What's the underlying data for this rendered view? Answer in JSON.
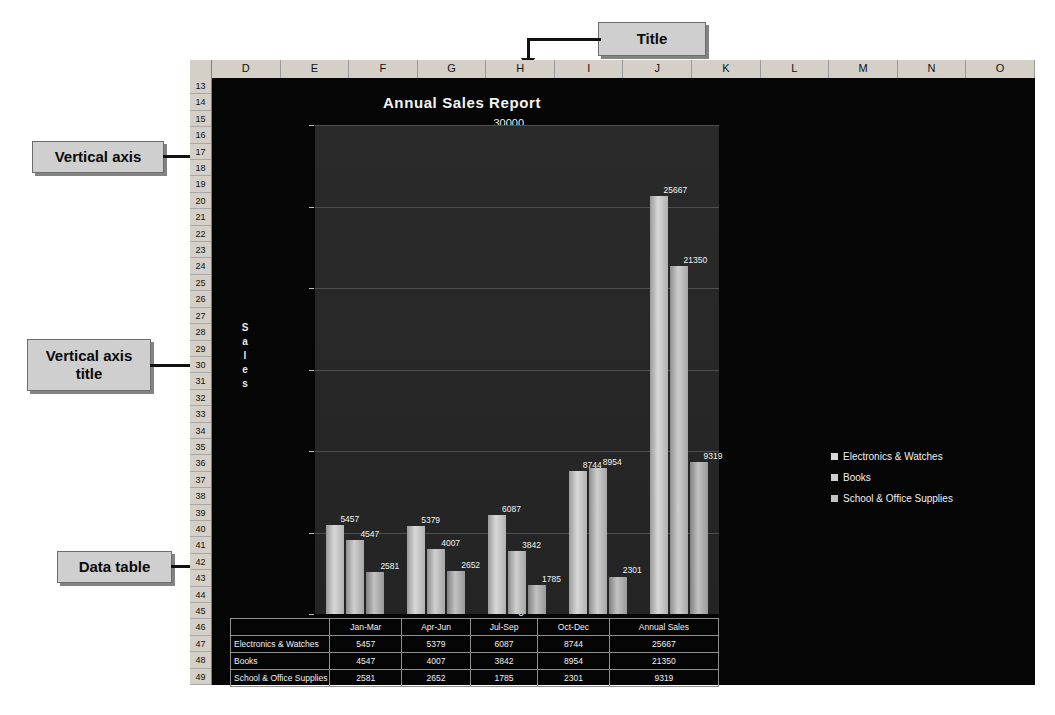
{
  "spreadsheet": {
    "columns": [
      "D",
      "E",
      "F",
      "G",
      "H",
      "I",
      "J",
      "K",
      "L",
      "M",
      "N",
      "O"
    ],
    "rows": [
      13,
      14,
      15,
      16,
      17,
      18,
      19,
      20,
      21,
      22,
      23,
      24,
      25,
      26,
      27,
      28,
      29,
      30,
      31,
      32,
      33,
      34,
      35,
      36,
      37,
      38,
      39,
      40,
      41,
      42,
      43,
      44,
      45,
      46,
      47,
      48,
      49
    ]
  },
  "chart_data": {
    "type": "bar",
    "title": "Annual Sales Report",
    "xlabel": "",
    "ylabel": "Sales",
    "ylim": [
      0,
      30000
    ],
    "yticks": [
      30000,
      25000,
      20000,
      15000,
      10000,
      5000,
      0
    ],
    "grid": true,
    "legend_position": "right",
    "categories": [
      "Jan-Mar",
      "Apr-Jun",
      "Jul-Sep",
      "Oct-Dec",
      "Annual Sales"
    ],
    "series": [
      {
        "name": "Electronics & Watches",
        "color": "#d8d8d8",
        "values": [
          5457,
          5379,
          6087,
          8744,
          25667
        ]
      },
      {
        "name": "Books",
        "color": "#cfcfcf",
        "values": [
          4547,
          4007,
          3842,
          8954,
          21350
        ]
      },
      {
        "name": "School & Office Supplies",
        "color": "#c2c2c2",
        "values": [
          2581,
          2652,
          1785,
          2301,
          9319
        ]
      }
    ],
    "data_labels": [
      "5457",
      "4547",
      "2581",
      "5379",
      "4007",
      "2652",
      "6087",
      "3842",
      "1785",
      "8744",
      "8954",
      "2301",
      "25667",
      "21350",
      "9319"
    ]
  },
  "data_table": {
    "header": [
      "",
      "Jan-Mar",
      "Apr-Jun",
      "Jul-Sep",
      "Oct-Dec",
      "Annual Sales"
    ],
    "rows": [
      [
        "Electronics & Watches",
        "5457",
        "5379",
        "6087",
        "8744",
        "25667"
      ],
      [
        "Books",
        "4547",
        "4007",
        "3842",
        "8954",
        "21350"
      ],
      [
        "School & Office Supplies",
        "2581",
        "2652",
        "1785",
        "2301",
        "9319"
      ]
    ]
  },
  "annotations": {
    "title": "Title",
    "vertical_axis": "Vertical axis",
    "vertical_axis_title": "Vertical axis title",
    "data_table": "Data table",
    "data_labels": "Data labels",
    "legends": "Legends",
    "horizontal_axis": "Horizontal axis"
  },
  "caption": ""
}
